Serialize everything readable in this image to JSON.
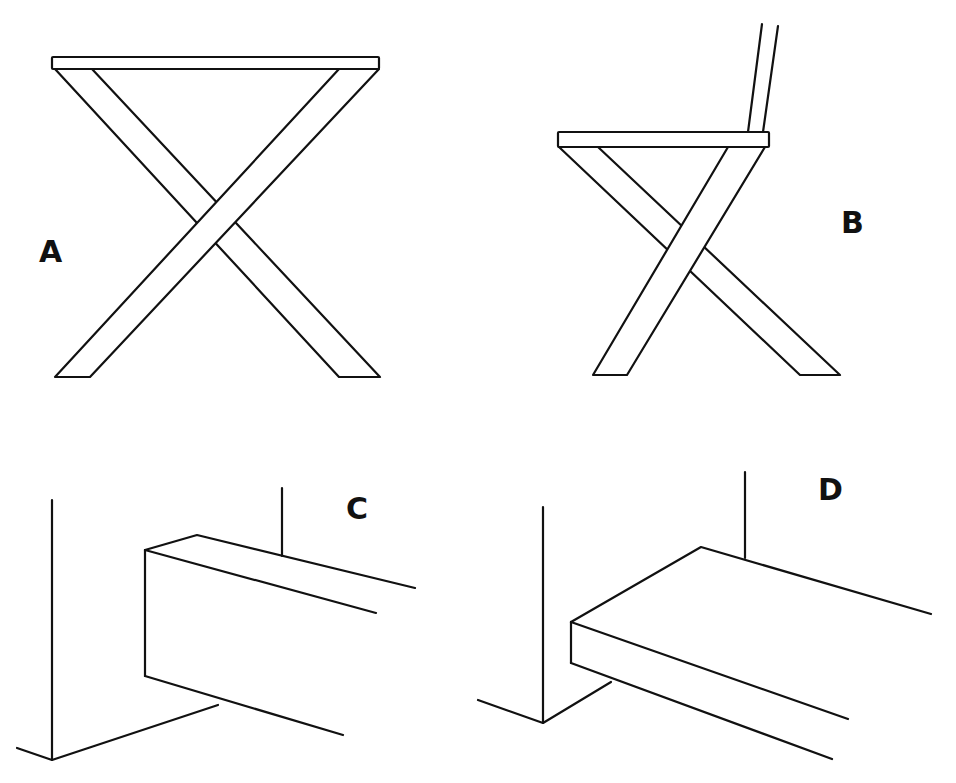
{
  "diagram": {
    "panels": [
      {
        "id": "A",
        "label": "A",
        "subject": "x-frame-table"
      },
      {
        "id": "B",
        "label": "B",
        "subject": "x-frame-chair-with-backrest"
      },
      {
        "id": "C",
        "label": "C",
        "subject": "vertical-board-against-wall-corner"
      },
      {
        "id": "D",
        "label": "D",
        "subject": "horizontal-board-against-wall-corner"
      }
    ],
    "colors": {
      "line": "#111111",
      "background": "#ffffff"
    }
  }
}
